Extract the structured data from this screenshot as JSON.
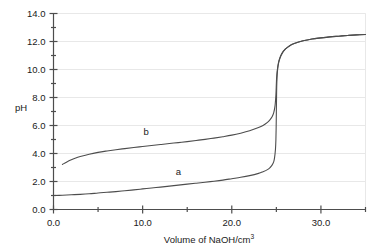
{
  "chart_data": {
    "type": "line",
    "title": "",
    "xlabel": "Volume of NaOH/cm3",
    "xlabel_main": "Volume of NaOH/cm",
    "xlabel_sup": "3",
    "ylabel": "pH",
    "xlim": [
      0,
      35
    ],
    "ylim": [
      0,
      14
    ],
    "grid": true,
    "legend": "inline-labels",
    "x_major_ticks": [
      0,
      10,
      20,
      30
    ],
    "x_major_tick_labels": [
      "0.0",
      "10.0",
      "20.0",
      "30.0"
    ],
    "x_minor_ticks": [
      5,
      15,
      25,
      35
    ],
    "y_major_ticks": [
      0,
      2,
      4,
      6,
      8,
      10,
      12,
      14
    ],
    "y_major_tick_labels": [
      "0.0",
      "2.0",
      "4.0",
      "6.0",
      "8.0",
      "10.0",
      "12.0",
      "14.0"
    ],
    "y_minor_ticks": [
      1,
      3,
      5,
      7,
      9,
      11,
      13
    ],
    "series": [
      {
        "name": "a",
        "label": "a",
        "label_x": 14.0,
        "label_y": 2.45,
        "color": "#4d4d4d",
        "points": [
          [
            0.0,
            1.0
          ],
          [
            1.0,
            1.02
          ],
          [
            2.0,
            1.05
          ],
          [
            3.0,
            1.08
          ],
          [
            4.0,
            1.12
          ],
          [
            5.0,
            1.18
          ],
          [
            6.0,
            1.23
          ],
          [
            7.0,
            1.28
          ],
          [
            8.0,
            1.34
          ],
          [
            9.0,
            1.4
          ],
          [
            10.0,
            1.47
          ],
          [
            11.0,
            1.54
          ],
          [
            12.0,
            1.6
          ],
          [
            13.0,
            1.67
          ],
          [
            14.0,
            1.74
          ],
          [
            15.0,
            1.81
          ],
          [
            16.0,
            1.88
          ],
          [
            17.0,
            1.95
          ],
          [
            18.0,
            2.02
          ],
          [
            19.0,
            2.1
          ],
          [
            20.0,
            2.2
          ],
          [
            21.0,
            2.3
          ],
          [
            22.0,
            2.42
          ],
          [
            23.0,
            2.58
          ],
          [
            23.5,
            2.7
          ],
          [
            24.0,
            2.85
          ],
          [
            24.3,
            3.0
          ],
          [
            24.5,
            3.15
          ],
          [
            24.7,
            3.4
          ],
          [
            24.8,
            3.7
          ],
          [
            24.9,
            4.3
          ],
          [
            24.95,
            5.0
          ],
          [
            24.98,
            6.0
          ],
          [
            25.0,
            7.0
          ],
          [
            25.02,
            8.0
          ],
          [
            25.05,
            9.0
          ],
          [
            25.1,
            9.7
          ],
          [
            25.2,
            10.3
          ],
          [
            25.4,
            10.8
          ],
          [
            25.7,
            11.2
          ],
          [
            26.0,
            11.45
          ],
          [
            26.5,
            11.7
          ],
          [
            27.0,
            11.85
          ],
          [
            28.0,
            12.05
          ],
          [
            29.0,
            12.18
          ],
          [
            30.0,
            12.26
          ],
          [
            31.0,
            12.33
          ],
          [
            32.0,
            12.38
          ],
          [
            33.0,
            12.43
          ],
          [
            34.0,
            12.47
          ],
          [
            35.0,
            12.5
          ]
        ]
      },
      {
        "name": "b",
        "label": "b",
        "label_x": 10.4,
        "label_y": 5.3,
        "color": "#4d4d4d",
        "points": [
          [
            1.0,
            3.22
          ],
          [
            1.5,
            3.4
          ],
          [
            2.0,
            3.55
          ],
          [
            2.5,
            3.68
          ],
          [
            3.0,
            3.78
          ],
          [
            4.0,
            3.95
          ],
          [
            5.0,
            4.08
          ],
          [
            6.0,
            4.18
          ],
          [
            7.0,
            4.27
          ],
          [
            8.0,
            4.35
          ],
          [
            9.0,
            4.43
          ],
          [
            10.0,
            4.5
          ],
          [
            11.0,
            4.57
          ],
          [
            12.0,
            4.64
          ],
          [
            13.0,
            4.71
          ],
          [
            14.0,
            4.78
          ],
          [
            15.0,
            4.85
          ],
          [
            16.0,
            4.93
          ],
          [
            17.0,
            5.01
          ],
          [
            18.0,
            5.1
          ],
          [
            19.0,
            5.2
          ],
          [
            20.0,
            5.31
          ],
          [
            21.0,
            5.45
          ],
          [
            22.0,
            5.62
          ],
          [
            23.0,
            5.85
          ],
          [
            23.5,
            6.0
          ],
          [
            24.0,
            6.22
          ],
          [
            24.3,
            6.42
          ],
          [
            24.5,
            6.6
          ],
          [
            24.7,
            6.9
          ],
          [
            24.85,
            7.4
          ],
          [
            24.95,
            8.2
          ],
          [
            25.0,
            9.0
          ],
          [
            25.05,
            9.6
          ],
          [
            25.15,
            10.15
          ],
          [
            25.3,
            10.65
          ],
          [
            25.6,
            11.15
          ],
          [
            26.0,
            11.45
          ],
          [
            26.5,
            11.7
          ],
          [
            27.0,
            11.85
          ],
          [
            28.0,
            12.05
          ],
          [
            29.0,
            12.18
          ],
          [
            30.0,
            12.26
          ],
          [
            31.0,
            12.33
          ],
          [
            32.0,
            12.38
          ],
          [
            33.0,
            12.43
          ],
          [
            34.0,
            12.47
          ],
          [
            35.0,
            12.5
          ]
        ]
      }
    ],
    "colors": {
      "curve": "#4d4d4d",
      "axis": "#4d4d4d",
      "grid": "#e8e8e8",
      "text": "#1a1a1a",
      "background": "#ffffff"
    }
  }
}
